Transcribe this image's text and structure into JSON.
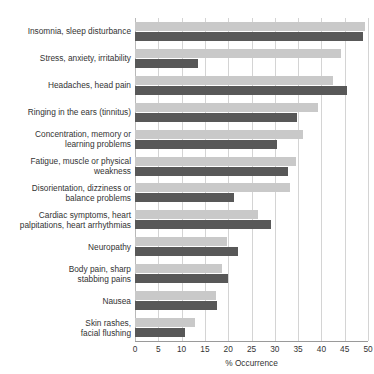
{
  "chart_data": {
    "type": "bar",
    "orientation": "horizontal",
    "title": "in Australia and the USA",
    "xlabel": "% Occurrence",
    "ylabel": "",
    "xlim": [
      0,
      50
    ],
    "xticks": [
      0,
      5,
      10,
      15,
      20,
      25,
      30,
      35,
      40,
      45,
      50
    ],
    "grid": true,
    "legend_position": "none",
    "categories": [
      "Insomnia, sleep disturbance",
      "Stress, anxiety, irritability",
      "Headaches, head pain",
      "Ringing in the ears (tinnitus)",
      "Concentration, memory or\nlearning problems",
      "Fatigue, muscle or physical\nweakness",
      "Disorientation, dizziness or\nbalance problems",
      "Cardiac symptoms, heart\npalpitations, heart arrhythmias",
      "Neuropathy",
      "Body pain, sharp\nstabbing pains",
      "Nausea",
      "Skin rashes,\nfacial flushing"
    ],
    "series": [
      {
        "name": "Series A",
        "color": "#c9c9c9",
        "values": [
          49.3,
          44.2,
          42.5,
          39.3,
          36.0,
          34.5,
          33.3,
          26.4,
          19.7,
          18.7,
          17.4,
          12.9
        ]
      },
      {
        "name": "Series B",
        "color": "#585858",
        "values": [
          49.0,
          13.5,
          45.5,
          34.8,
          30.5,
          32.8,
          21.2,
          29.2,
          22.1,
          20.0,
          17.6,
          10.7
        ]
      }
    ]
  },
  "axis": {
    "x_tick_labels": [
      "0",
      "5",
      "10",
      "15",
      "20",
      "25",
      "30",
      "35",
      "40",
      "45",
      "50"
    ]
  }
}
